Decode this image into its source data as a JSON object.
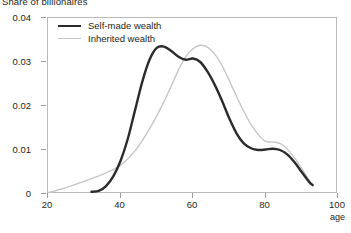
{
  "chart_data": {
    "type": "line",
    "title": "Share of billionaires",
    "xlabel": "age",
    "ylabel": "",
    "xlim": [
      20,
      100
    ],
    "ylim": [
      0,
      0.04
    ],
    "xticks": [
      20,
      40,
      60,
      80,
      100
    ],
    "xtick_labels": [
      "20",
      "40",
      "60",
      "80",
      "100"
    ],
    "yticks": [
      0,
      0.01,
      0.02,
      0.03,
      0.04
    ],
    "ytick_labels": [
      "0",
      "0.01",
      "0.02",
      "0.03",
      "0.04"
    ],
    "grid": false,
    "legend_position": "top-left",
    "series": [
      {
        "name": "Self-made wealth",
        "color": "#2b2b2b",
        "x": [
          32,
          34,
          36,
          38,
          40,
          42,
          44,
          46,
          48,
          50,
          52,
          54,
          56,
          58,
          60,
          62,
          64,
          66,
          68,
          70,
          72,
          74,
          76,
          78,
          80,
          82,
          84,
          86,
          88,
          90,
          92,
          93
        ],
        "y": [
          0.0005,
          0.0007,
          0.0018,
          0.004,
          0.0075,
          0.0125,
          0.019,
          0.0255,
          0.0305,
          0.0332,
          0.0335,
          0.0325,
          0.0312,
          0.0305,
          0.0308,
          0.03,
          0.0278,
          0.0248,
          0.0212,
          0.0172,
          0.0138,
          0.0115,
          0.0104,
          0.01,
          0.0101,
          0.0103,
          0.01,
          0.009,
          0.0072,
          0.005,
          0.0028,
          0.002
        ]
      },
      {
        "name": "Inherited wealth",
        "color": "#c6c6c6",
        "x": [
          20,
          24,
          28,
          32,
          36,
          40,
          44,
          48,
          52,
          56,
          58,
          60,
          62,
          64,
          66,
          68,
          70,
          72,
          74,
          76,
          78,
          80,
          82,
          84,
          86,
          88,
          90,
          92,
          93
        ],
        "y": [
          0.0003,
          0.0012,
          0.0023,
          0.0035,
          0.0048,
          0.0065,
          0.0098,
          0.0148,
          0.021,
          0.0282,
          0.0312,
          0.033,
          0.0338,
          0.0334,
          0.0318,
          0.0292,
          0.0258,
          0.0222,
          0.0188,
          0.0158,
          0.0135,
          0.012,
          0.0118,
          0.0115,
          0.0102,
          0.0082,
          0.0058,
          0.0032,
          0.0022
        ]
      }
    ]
  },
  "legend": {
    "items": [
      {
        "label": "Self-made wealth"
      },
      {
        "label": "Inherited wealth"
      }
    ]
  },
  "colors": {
    "self_made": "#2b2b2b",
    "inherited": "#c6c6c6",
    "axis": "#b9b9b9",
    "text": "#231f20"
  }
}
